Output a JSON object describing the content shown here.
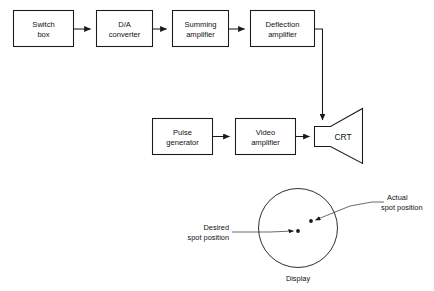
{
  "figure": {
    "stroke_color": "#1a1a1a",
    "grid_color": "#8d8d8d",
    "background": "#ffffff"
  },
  "blocks": [
    {
      "id": "switch-box",
      "line1": "Switch",
      "line2": "box"
    },
    {
      "id": "da-converter",
      "line1": "D/A",
      "line2": "converter"
    },
    {
      "id": "summing-amplifier",
      "line1": "Summing",
      "line2": "amplifier"
    },
    {
      "id": "deflection-amplifier",
      "line1": "Deflection",
      "line2": "amplifier"
    },
    {
      "id": "pulse-generator",
      "line1": "Pulse",
      "line2": "generator"
    },
    {
      "id": "video-amplifier",
      "line1": "Video",
      "line2": "amplifier"
    }
  ],
  "crt": {
    "label": "CRT"
  },
  "display": {
    "caption": "Display",
    "annotations": {
      "desired": {
        "line1": "Desired",
        "line2": "spot  position"
      },
      "actual": {
        "line1": "Actual",
        "line2": "spot  position"
      }
    },
    "grid": {
      "spacing_px": 10,
      "columns": 8,
      "rows": 8
    },
    "spots": [
      {
        "name": "desired-spot",
        "x": 298,
        "y": 231
      },
      {
        "name": "actual-spot",
        "x": 311,
        "y": 221
      }
    ]
  }
}
